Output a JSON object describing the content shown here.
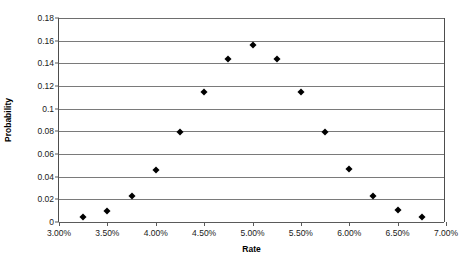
{
  "chart_data": {
    "type": "scatter",
    "title": "",
    "xlabel": "Rate",
    "ylabel": "Probability",
    "xlim": [
      3.0,
      7.0
    ],
    "ylim": [
      0,
      0.18
    ],
    "grid": true,
    "legend": null,
    "xtick_labels": [
      "3.00%",
      "3.50%",
      "4.00%",
      "4.50%",
      "5.00%",
      "5.50%",
      "6.00%",
      "6.50%",
      "7.00%"
    ],
    "xtick_values": [
      3.0,
      3.5,
      4.0,
      4.5,
      5.0,
      5.5,
      6.0,
      6.5,
      7.0
    ],
    "ytick_labels": [
      "0.18",
      "0.16",
      "0.14",
      "0.12",
      "0.1",
      "0.08",
      "0.06",
      "0.04",
      "0.02",
      "0"
    ],
    "ytick_values": [
      0.18,
      0.16,
      0.14,
      0.12,
      0.1,
      0.08,
      0.06,
      0.04,
      0.02,
      0
    ],
    "marker_shape": "diamond",
    "marker_color": "#000000",
    "x": [
      3.25,
      3.5,
      3.75,
      4.0,
      4.25,
      4.5,
      4.75,
      5.0,
      5.25,
      5.5,
      5.75,
      6.0,
      6.25,
      6.5,
      6.75
    ],
    "y": [
      0.004,
      0.01,
      0.023,
      0.046,
      0.079,
      0.115,
      0.144,
      0.156,
      0.144,
      0.115,
      0.079,
      0.047,
      0.023,
      0.011,
      0.004
    ],
    "points": [
      {
        "x": 3.25,
        "y": 0.004
      },
      {
        "x": 3.5,
        "y": 0.01
      },
      {
        "x": 3.75,
        "y": 0.023
      },
      {
        "x": 4.0,
        "y": 0.046
      },
      {
        "x": 4.25,
        "y": 0.079
      },
      {
        "x": 4.5,
        "y": 0.115
      },
      {
        "x": 4.75,
        "y": 0.144
      },
      {
        "x": 5.0,
        "y": 0.156
      },
      {
        "x": 5.25,
        "y": 0.144
      },
      {
        "x": 5.5,
        "y": 0.115
      },
      {
        "x": 5.75,
        "y": 0.079
      },
      {
        "x": 6.0,
        "y": 0.047
      },
      {
        "x": 6.25,
        "y": 0.023
      },
      {
        "x": 6.5,
        "y": 0.011
      },
      {
        "x": 6.75,
        "y": 0.004
      }
    ]
  }
}
